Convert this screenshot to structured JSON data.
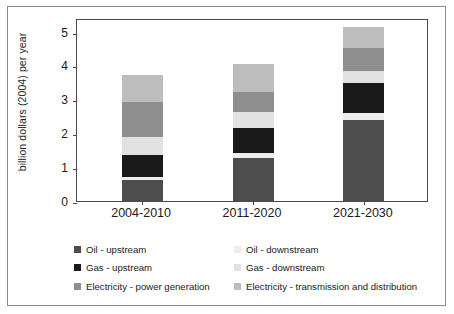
{
  "chart_data": {
    "type": "bar",
    "subtype": "stacked-bar",
    "title": "",
    "xlabel": "",
    "ylabel": "billion dollars (2004) per year",
    "categories": [
      "2004-2010",
      "2011-2020",
      "2021-2030"
    ],
    "ylim": [
      0,
      5.4
    ],
    "yticks": [
      0,
      1,
      2,
      3,
      4,
      5
    ],
    "ytick_labels": [
      "0",
      "1",
      "2",
      "3",
      "4",
      "5"
    ],
    "grid": false,
    "legend_position": "bottom",
    "series": [
      {
        "name": "Oil - upstream",
        "color": "#4d4d4d",
        "values": [
          0.62,
          1.28,
          2.39
        ]
      },
      {
        "name": "Oil - downstream",
        "color": "#ededed",
        "values": [
          0.08,
          0.15,
          0.22
        ]
      },
      {
        "name": "Gas - upstream",
        "color": "#191919",
        "values": [
          0.67,
          0.72,
          0.86
        ]
      },
      {
        "name": "Gas - downstream",
        "color": "#e2e2e2",
        "values": [
          0.53,
          0.49,
          0.36
        ]
      },
      {
        "name": "Electricity - power generation",
        "color": "#8e8e8e",
        "values": [
          1.02,
          0.58,
          0.69
        ]
      },
      {
        "name": "Electricity - transmission and distribution",
        "color": "#bdbdbd",
        "values": [
          0.8,
          0.83,
          0.61
        ]
      }
    ],
    "stack_totals": [
      3.72,
      4.05,
      5.13
    ]
  },
  "legend": {
    "left_column": [
      {
        "label": "Oil - upstream",
        "color": "#4d4d4d"
      },
      {
        "label": "Gas - upstream",
        "color": "#191919"
      },
      {
        "label": "Electricity - power generation",
        "color": "#8e8e8e"
      }
    ],
    "right_column": [
      {
        "label": "Oil - downstream",
        "color": "#ededed"
      },
      {
        "label": "Gas - downstream",
        "color": "#e2e2e2"
      },
      {
        "label": "Electricity - transmission and distribution",
        "color": "#bdbdbd"
      }
    ]
  }
}
